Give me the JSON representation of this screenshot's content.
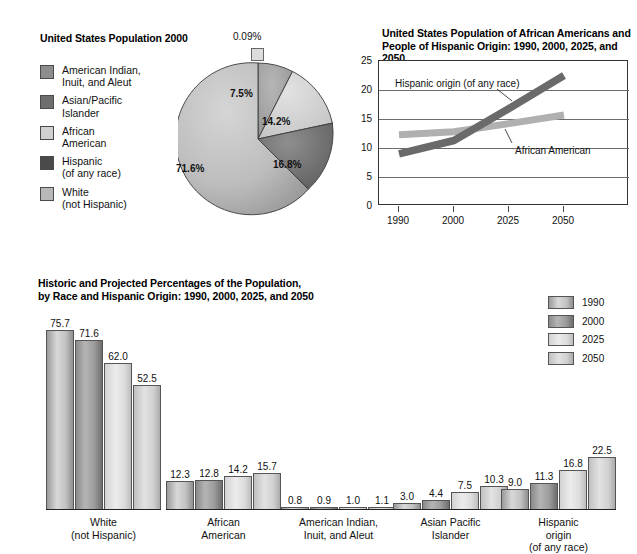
{
  "pie_section": {
    "title": "United States Population 2000",
    "legend": [
      {
        "label": "American Indian,\nInuit, and Aleut",
        "color": "#8d8d8d"
      },
      {
        "label": "Asian/Pacific\nIslander",
        "color": "#6e6e6e"
      },
      {
        "label": "African\nAmerican",
        "color": "#d0d0d0"
      },
      {
        "label": "Hispanic\n(of any race)",
        "color": "#4a4a4a"
      },
      {
        "label": "White\n(not Hispanic)",
        "color": "#b8b8b8"
      }
    ],
    "slice_labels": [
      "0.09%",
      "7.5%",
      "14.2%",
      "16.8%",
      "71.6%"
    ]
  },
  "line_section": {
    "title": "United States Population of African Americans and\nPeople of Hispanic Origin: 1990, 2000, 2025, and 2050",
    "annotation_hispanic": "Hispanic origin (of any race)",
    "annotation_african": "African American"
  },
  "bar_section": {
    "title": "Historic and Projected Percentages of the Population,\nby Race and Hispanic Origin: 1990, 2000, 2025, and 2050",
    "legend": [
      {
        "label": "1990",
        "color": "#c2c2c2"
      },
      {
        "label": "2000",
        "color": "#9c9c9c"
      },
      {
        "label": "2025",
        "color": "#e4e4e4"
      },
      {
        "label": "2050",
        "color": "#d2d2d2"
      }
    ]
  },
  "chart_data": [
    {
      "type": "pie",
      "title": "United States Population 2000",
      "categories": [
        "American Indian, Inuit, and Aleut",
        "Asian/Pacific Islander",
        "African American",
        "Hispanic (of any race)",
        "White (not Hispanic)"
      ],
      "values": [
        0.09,
        7.5,
        14.2,
        16.8,
        71.6
      ],
      "data_labels": [
        "0.09%",
        "7.5%",
        "14.2%",
        "16.8%",
        "71.6%"
      ],
      "colors": [
        "#8d8d8d",
        "#6e6e6e",
        "#d0d0d0",
        "#4a4a4a",
        "#b8b8b8"
      ],
      "legend": "left",
      "note": "Slices sum above 100 because Hispanic origin overlaps race categories"
    },
    {
      "type": "line",
      "title": "United States Population of African Americans and People of Hispanic Origin: 1990, 2000, 2025, and 2050",
      "x": [
        "1990",
        "2000",
        "2025",
        "2050"
      ],
      "xlabel": "",
      "ylabel": "",
      "ylim": [
        0,
        25
      ],
      "yticks": [
        0,
        5,
        10,
        15,
        20,
        25
      ],
      "grid": true,
      "legend": "annotations",
      "series": [
        {
          "name": "Hispanic origin (of any race)",
          "values": [
            9.0,
            11.3,
            16.8,
            22.5
          ],
          "color": "#6b6b6b"
        },
        {
          "name": "African American",
          "values": [
            12.3,
            12.8,
            14.2,
            15.7
          ],
          "color": "#b4b4b4"
        }
      ]
    },
    {
      "type": "bar",
      "title": "Historic and Projected Percentages of the Population, by Race and Hispanic Origin: 1990, 2000, 2025, and 2050",
      "categories": [
        "White\n(not Hispanic)",
        "African\nAmerican",
        "American Indian,\nInuit, and Aleut",
        "Asian Pacific\nIslander",
        "Hispanic\norigin\n(of any race)"
      ],
      "series": [
        {
          "name": "1990",
          "values": [
            75.7,
            12.3,
            0.8,
            3.0,
            9.0
          ],
          "color": "#c2c2c2"
        },
        {
          "name": "2000",
          "values": [
            71.6,
            12.8,
            0.9,
            4.4,
            11.3
          ],
          "color": "#9c9c9c"
        },
        {
          "name": "2025",
          "values": [
            62.0,
            14.2,
            1.0,
            7.5,
            16.8
          ],
          "color": "#e4e4e4"
        },
        {
          "name": "2050",
          "values": [
            52.5,
            15.7,
            1.1,
            10.3,
            22.5
          ],
          "color": "#d2d2d2"
        }
      ],
      "ylim": [
        0,
        80
      ],
      "grid": false,
      "data_labels": true,
      "legend": "right"
    }
  ]
}
